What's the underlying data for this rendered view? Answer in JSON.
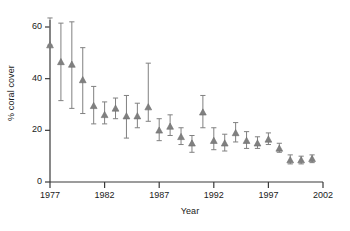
{
  "chart_data": {
    "type": "scatter",
    "title": "",
    "xlabel": "Year",
    "ylabel": "% coral cover",
    "xlim": [
      1977,
      2002
    ],
    "ylim": [
      0,
      65
    ],
    "xticks": [
      1977,
      1982,
      1987,
      1992,
      1997,
      2002
    ],
    "xticklabels": [
      "1977",
      "1982",
      "1987",
      "1992",
      "1997",
      "2002"
    ],
    "yticks": [
      0,
      20,
      40,
      60
    ],
    "yticklabels": [
      "0",
      "20",
      "40",
      "60"
    ],
    "grid": false,
    "legend": null,
    "marker": "triangle-up",
    "marker_color": "#808080",
    "errorbar_color": "#808080",
    "errorbar_style": "vertical-with-caps",
    "x": [
      1977,
      1978,
      1979,
      1980,
      1981,
      1982,
      1983,
      1984,
      1985,
      1986,
      1987,
      1988,
      1989,
      1990,
      1991,
      1992,
      1993,
      1994,
      1995,
      1996,
      1997,
      1998,
      1999,
      2000,
      2001
    ],
    "values": [
      53.0,
      46.5,
      45.5,
      39.5,
      29.5,
      26.0,
      28.5,
      25.5,
      25.5,
      29.0,
      20.0,
      21.5,
      17.5,
      15.0,
      27.0,
      16.0,
      15.0,
      19.0,
      16.0,
      15.0,
      16.5,
      13.0,
      8.5,
      8.5,
      9.0
    ],
    "err_low": [
      53.0,
      31.5,
      28.5,
      26.5,
      22.5,
      22.5,
      24.5,
      17.0,
      21.0,
      23.5,
      16.0,
      18.0,
      14.5,
      11.5,
      21.0,
      12.5,
      12.0,
      15.5,
      13.0,
      13.0,
      14.5,
      11.5,
      7.0,
      7.0,
      7.5
    ],
    "err_high": [
      63.5,
      61.5,
      62.0,
      52.0,
      37.0,
      31.0,
      32.5,
      33.5,
      30.5,
      46.0,
      24.5,
      26.0,
      21.0,
      18.0,
      33.5,
      21.0,
      18.5,
      23.0,
      19.5,
      17.5,
      19.0,
      15.0,
      10.5,
      10.0,
      10.5
    ]
  },
  "axes": {
    "y_axis_name": "y-axis",
    "x_axis_name": "x-axis"
  }
}
